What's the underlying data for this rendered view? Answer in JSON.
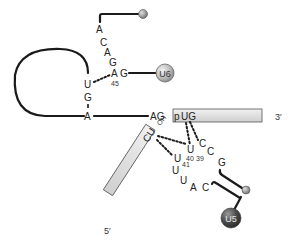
{
  "diagram": {
    "upper_strand": {
      "nucleotides": [
        "A",
        "C",
        "A",
        "G",
        "A",
        "G"
      ],
      "position_label": "45"
    },
    "loop_strand": {
      "nucleotides": [
        "U",
        "G",
        "A"
      ]
    },
    "u6_label": "U6",
    "u5_label": "U5",
    "junction": {
      "left": "AG",
      "box_text_p": "p",
      "box_text": "UG",
      "three_prime": "3′"
    },
    "lower_box": {
      "text": "CU",
      "oh": "OH",
      "five_prime": "5′"
    },
    "u5_strand": {
      "nucleotides": [
        "U",
        "U",
        "U",
        "U",
        "A",
        "C"
      ],
      "numbers": [
        "40",
        "41",
        "39"
      ],
      "c_upper": "C",
      "c_mid": "C",
      "g": "G"
    },
    "colors": {
      "strand": "#1a1a1a",
      "box_fill": "#d9d9d9",
      "box_stroke": "#555555",
      "sphere_light": "#c8c8c8",
      "sphere_dark": "#4a4a4a"
    }
  }
}
